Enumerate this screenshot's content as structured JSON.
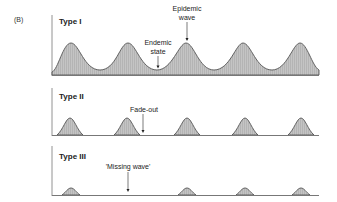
{
  "figure": {
    "panel_label": "(B)",
    "colors": {
      "fill": "#bdbdbd",
      "stroke": "#555555",
      "axis": "#777777",
      "text": "#222222"
    }
  },
  "panels": [
    {
      "title": "Type I",
      "annotations": [
        {
          "line1": "Epidemic",
          "line2": "wave"
        },
        {
          "line1": "Endemic",
          "line2": "state"
        }
      ]
    },
    {
      "title": "Type II",
      "annotations": [
        {
          "line1": "Fade-out"
        }
      ]
    },
    {
      "title": "Type III",
      "annotations": [
        {
          "line1": "'Missing wave'"
        }
      ]
    }
  ]
}
